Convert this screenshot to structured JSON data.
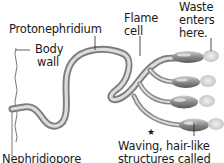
{
  "diagram": {
    "labels": {
      "protonephridium": "Protonephridium",
      "body_wall_line1": "Body",
      "body_wall_line2": "wall",
      "flame_cell_line1": "Flame",
      "flame_cell_line2": "cell",
      "waste_line1": "Waste",
      "waste_line2": "enters",
      "waste_line3": "here.",
      "waving_line1": "Waving, hair-like",
      "waving_line2": "structures called",
      "nephridiopore": "Nephridiopore",
      "star": "★"
    },
    "flame_cell_count": 4,
    "colors": {
      "background": "#ffffff",
      "tube_dark": "#8a8a8a",
      "tube_light": "#d9d9d9",
      "text": "#1a1a1a"
    }
  }
}
